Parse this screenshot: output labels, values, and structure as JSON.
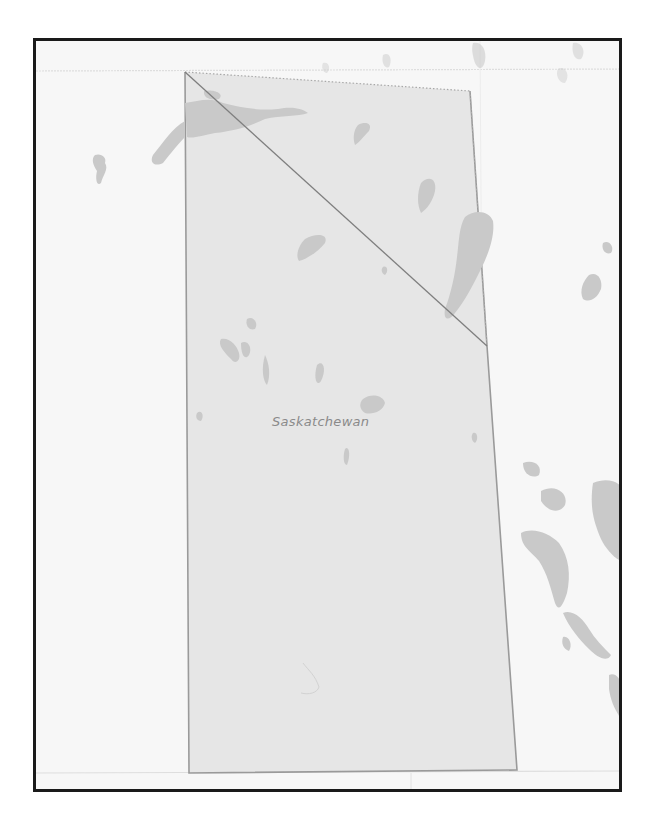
{
  "map": {
    "region_label": "Saskatchewan",
    "colors": {
      "background": "#f7f7f7",
      "region_fill": "#e6e6e6",
      "region_stroke": "#9a9a9a",
      "water": "#c9c9c9",
      "frame_border": "#1a1a1a",
      "gridline": "#dedede",
      "label": "#8a8a8a"
    },
    "region_polygon": [
      [
        182,
        69
      ],
      [
        467,
        88
      ],
      [
        484,
        343
      ],
      [
        514,
        767
      ],
      [
        186,
        770
      ]
    ],
    "diagonal_line": [
      [
        182,
        69
      ],
      [
        484,
        343
      ]
    ]
  }
}
